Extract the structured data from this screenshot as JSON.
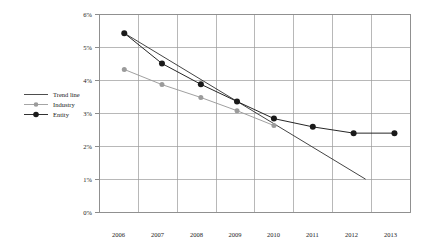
{
  "chart_data": {
    "type": "line",
    "title": "",
    "subtitle": "",
    "xlabel": "",
    "ylabel": "",
    "categories": [
      "2006",
      "2007",
      "2008",
      "2009",
      "2010",
      "2011",
      "2012",
      "2013"
    ],
    "x_tick_labels": [
      "2006",
      "2007",
      "2008",
      "2009",
      "2010",
      "2011",
      "2012",
      "2013"
    ],
    "y_tick_labels": [
      "0%",
      "1%",
      "2%",
      "3%",
      "4%",
      "5%",
      "6%"
    ],
    "y_tick_values": [
      0,
      1,
      2,
      3,
      4,
      5,
      6
    ],
    "ylim": [
      0,
      6
    ],
    "xlim": [
      2005.5,
      2013.5
    ],
    "grid": true,
    "legend_position": "left-outside",
    "series": [
      {
        "name": "Trend line",
        "type": "line",
        "marker": "none",
        "color": "#3a3a3a",
        "x": [
          2006.15,
          2012.35
        ],
        "values": [
          5.42,
          1.0
        ]
      },
      {
        "name": "Industry",
        "type": "line",
        "marker": "circle",
        "color": "#9b9b9b",
        "x": [
          2006.15,
          2007.12,
          2008.12,
          2009.05,
          2010.0
        ],
        "values": [
          4.32,
          3.86,
          3.47,
          3.07,
          2.62
        ]
      },
      {
        "name": "Entity",
        "type": "line",
        "marker": "circle",
        "color": "#1a1a1a",
        "x": [
          2006.15,
          2007.12,
          2008.12,
          2009.05,
          2010.0,
          2011.0,
          2012.05,
          2013.1
        ],
        "values": [
          5.42,
          4.5,
          3.87,
          3.35,
          2.83,
          2.58,
          2.39,
          2.39
        ]
      }
    ],
    "legend": [
      {
        "label": "Trend line",
        "marker": "line",
        "color": "#3a3a3a"
      },
      {
        "label": "Industry",
        "marker": "line-circle",
        "color": "#9b9b9b"
      },
      {
        "label": "Entity",
        "marker": "line-circle",
        "color": "#1a1a1a"
      }
    ]
  },
  "colors": {
    "trend_line": "#3a3a3a",
    "industry": "#9b9b9b",
    "entity": "#1a1a1a",
    "gridline": "#9a9a9a",
    "border": "#8c8c8c",
    "background": "#ffffff"
  }
}
